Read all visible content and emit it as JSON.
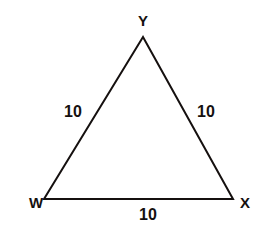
{
  "figure": {
    "type": "geometry-diagram",
    "shape": "triangle",
    "background_color": "#ffffff",
    "stroke_color": "#15100f",
    "text_color": "#15100f",
    "stroke_width": 2,
    "vertices": [
      {
        "name": "Y",
        "label": "Y",
        "x": 143,
        "y": 37,
        "label_x": 143,
        "label_y": 20,
        "position": "apex-top"
      },
      {
        "name": "W",
        "label": "W",
        "x": 44,
        "y": 199,
        "label_x": 36,
        "label_y": 202,
        "position": "bottom-left"
      },
      {
        "name": "X",
        "label": "X",
        "x": 233,
        "y": 199,
        "label_x": 245,
        "label_y": 202,
        "position": "bottom-right"
      }
    ],
    "sides": [
      {
        "id": "WY",
        "from": "W",
        "to": "Y",
        "length_label": "10",
        "label_x": 73,
        "label_y": 112,
        "position": "left"
      },
      {
        "id": "YX",
        "from": "Y",
        "to": "X",
        "length_label": "10",
        "label_x": 206,
        "label_y": 112,
        "position": "right"
      },
      {
        "id": "WX",
        "from": "W",
        "to": "X",
        "length_label": "10",
        "label_x": 148,
        "label_y": 215,
        "position": "bottom"
      }
    ]
  }
}
